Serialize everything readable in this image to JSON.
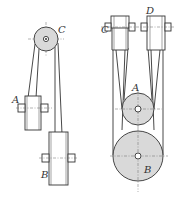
{
  "figure": {
    "left_diagram": {
      "labels": {
        "top_pulley": "C",
        "middle_shaft": "A",
        "bottom_shaft": "B"
      }
    },
    "right_diagram": {
      "labels": {
        "top_left_shaft": "C",
        "top_right_shaft": "D",
        "small_pulley": "A",
        "large_pulley": "B"
      }
    },
    "colors": {
      "pulley_fill": "#d9d9d9",
      "stroke": "#333333",
      "background": "#ffffff"
    }
  }
}
